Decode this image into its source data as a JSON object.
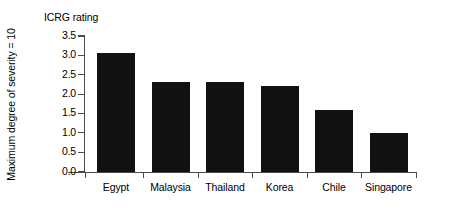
{
  "chart_data": {
    "type": "bar",
    "title": "",
    "caption": "ICRG rating",
    "ylabel": "Maximum degree of severity = 10",
    "xlabel": "",
    "categories": [
      "Egypt",
      "Malaysia",
      "Thailand",
      "Korea",
      "Chile",
      "Singapore"
    ],
    "values": [
      3.05,
      2.3,
      2.3,
      2.2,
      1.6,
      1.0
    ],
    "ylim": [
      0.0,
      3.5
    ],
    "yticks": [
      "0.0",
      "0.5",
      "1.0",
      "1.5",
      "2.0",
      "2.5",
      "3.0",
      "3.5"
    ],
    "ytick_values": [
      0.0,
      0.5,
      1.0,
      1.5,
      2.0,
      2.5,
      3.0,
      3.5
    ],
    "grid": false,
    "legend": null,
    "bar_color": "#111111",
    "axis_color": "#4a4a4a",
    "background_color": "#ffffff"
  }
}
